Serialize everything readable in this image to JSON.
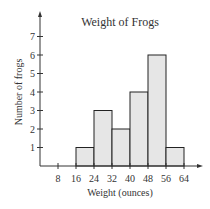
{
  "chart_data": {
    "type": "bar",
    "title": "Weight of Frogs",
    "xlabel": "Weight (ounces)",
    "ylabel": "Number of frogs",
    "x_ticks": [
      8,
      16,
      24,
      32,
      40,
      48,
      56,
      64
    ],
    "y_ticks": [
      1,
      2,
      3,
      4,
      5,
      6,
      7
    ],
    "bins": [
      {
        "start": 16,
        "end": 24,
        "count": 1
      },
      {
        "start": 24,
        "end": 32,
        "count": 3
      },
      {
        "start": 32,
        "end": 40,
        "count": 2
      },
      {
        "start": 40,
        "end": 48,
        "count": 4
      },
      {
        "start": 48,
        "end": 56,
        "count": 6
      },
      {
        "start": 56,
        "end": 64,
        "count": 1
      }
    ],
    "categories": [
      "16-24",
      "24-32",
      "32-40",
      "40-48",
      "48-56",
      "56-64"
    ],
    "values": [
      1,
      3,
      2,
      4,
      6,
      1
    ],
    "ylim": [
      0,
      7.5
    ],
    "grid": false,
    "colors": {
      "bar_fill": "#e6e6e6",
      "bar_stroke": "#222222",
      "axis": "#333333"
    }
  }
}
